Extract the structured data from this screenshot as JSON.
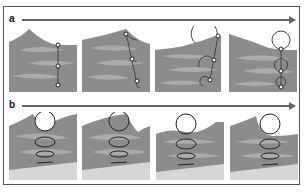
{
  "figure": {
    "rows": [
      {
        "label": "a",
        "description": "Sequence of four block-diagram panels showing a vertical line of particle markers deforming as a wave crest passes (orbital motion of particles)",
        "panels": [
          {
            "index": 1,
            "markers": 3,
            "orbits": "none"
          },
          {
            "index": 2,
            "markers": 3,
            "orbits": "tilted line with small arcs"
          },
          {
            "index": 3,
            "markers": 3,
            "orbits": "partial circular orbits decreasing with depth"
          },
          {
            "index": 4,
            "markers": 3,
            "orbits": "full circular orbits decreasing with depth"
          }
        ]
      },
      {
        "label": "b",
        "description": "Sequence of four panels showing circular orbital motion at surface and elliptical orbits flattening with depth above a sandy bottom (shallow-water waves)",
        "panels": [
          {
            "index": 1,
            "orbits": [
              "circle",
              "ellipse",
              "flat ellipse",
              "line"
            ]
          },
          {
            "index": 2,
            "orbits": [
              "circle",
              "ellipse",
              "flat ellipse",
              "line"
            ]
          },
          {
            "index": 3,
            "orbits": [
              "circle",
              "ellipse",
              "flat ellipse",
              "line"
            ]
          },
          {
            "index": 4,
            "orbits": [
              "circle",
              "ellipse",
              "flat ellipse",
              "line"
            ]
          }
        ]
      }
    ],
    "colors": {
      "water_dark": "#8c8c8c",
      "water_light": "#b3b3b3",
      "sand": "#d6d6d6",
      "line": "#333333",
      "arrow": "#666666"
    }
  }
}
